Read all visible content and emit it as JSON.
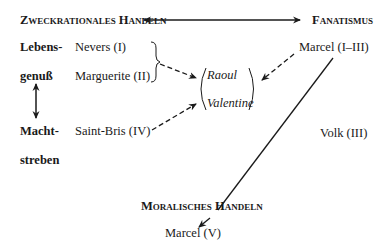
{
  "header": {
    "left_pole": "Zweckrationales Handeln",
    "right_pole": "Fanatismus"
  },
  "left_column": {
    "top_label_1": "Lebens-",
    "top_label_2": "genuß",
    "bottom_label_1": "Macht-",
    "bottom_label_2": "streben"
  },
  "characters": {
    "nevers": "Nevers (I)",
    "marguerite": "Marguerite (II)",
    "saint_bris": "Saint-Bris (IV)",
    "marcel_top": "Marcel (I–III)",
    "volk": "Volk (III)",
    "raoul": "Raoul",
    "valentine": "Valentine",
    "marcel_bottom": "Marcel (V)"
  },
  "bottom": {
    "moral_label": "Moralisches Handeln"
  },
  "colors": {
    "text": "#1a1a1a",
    "lines": "#1a1a1a",
    "background": "#ffffff"
  }
}
